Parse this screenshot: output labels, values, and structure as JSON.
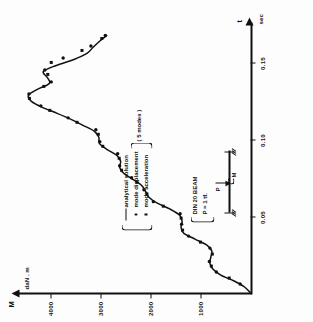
{
  "figure": {
    "orientation": "rotated-90-ccw",
    "axes": {
      "x": {
        "name": "t",
        "unit": "sec",
        "ticks": [
          "0.05",
          "0.10",
          "0.15"
        ],
        "tick_values": [
          0.05,
          0.1,
          0.15
        ],
        "range": [
          0.0,
          0.175
        ]
      },
      "y": {
        "name": "M",
        "unit": "daN . m",
        "ticks": [
          "1000",
          "2000",
          "3000",
          "4000"
        ],
        "tick_values": [
          1000,
          2000,
          3000,
          4000
        ],
        "range": [
          0,
          4600
        ]
      }
    },
    "legend": {
      "items": [
        {
          "mark": "line",
          "label": "analytical solution"
        },
        {
          "mark": "dot",
          "label": "mode displacement"
        },
        {
          "mark": "square",
          "label": "mode acceleration"
        }
      ],
      "group_note": "( 5 modes )"
    },
    "annotation": {
      "brace_lines": [
        "DIN 20 BEAM",
        "P = 1 tf."
      ],
      "sketch": {
        "load_label": "P",
        "moment_label": "M"
      }
    }
  },
  "chart_data": {
    "type": "line",
    "title": "",
    "xlabel": "t  sec",
    "ylabel": "M  daN . m",
    "xlim": [
      0.0,
      0.175
    ],
    "ylim": [
      0,
      4600
    ],
    "grid": false,
    "legend_position": "inside-center",
    "series": [
      {
        "name": "analytical solution",
        "style": "line",
        "x": [
          0.0,
          0.004,
          0.008,
          0.012,
          0.016,
          0.02,
          0.024,
          0.028,
          0.032,
          0.036,
          0.04,
          0.044,
          0.048,
          0.052,
          0.056,
          0.06,
          0.064,
          0.068,
          0.072,
          0.076,
          0.08,
          0.084,
          0.088,
          0.092,
          0.096,
          0.1,
          0.104,
          0.108,
          0.112,
          0.116,
          0.12,
          0.124,
          0.128,
          0.132,
          0.136,
          0.14,
          0.144,
          0.148,
          0.152,
          0.156,
          0.16,
          0.164,
          0.168,
          0.172
        ],
        "y": [
          0,
          120,
          330,
          600,
          760,
          820,
          800,
          780,
          880,
          1120,
          1350,
          1400,
          1380,
          1430,
          1620,
          1880,
          2050,
          2120,
          2200,
          2380,
          2560,
          2640,
          2620,
          2700,
          2900,
          3050,
          3060,
          3150,
          3380,
          3620,
          3900,
          4200,
          4420,
          4480,
          4300,
          4060,
          4100,
          4180,
          3920,
          3560,
          3300,
          3180,
          3050,
          2900
        ]
      },
      {
        "name": "mode displacement",
        "style": "dot",
        "x": [
          0.006,
          0.014,
          0.021,
          0.03,
          0.038,
          0.046,
          0.053,
          0.061,
          0.069,
          0.077,
          0.085,
          0.093,
          0.101,
          0.109,
          0.117,
          0.125,
          0.133,
          0.141,
          0.149,
          0.157,
          0.165,
          0.172
        ],
        "y": [
          210,
          690,
          830,
          820,
          1250,
          1390,
          1420,
          1960,
          2150,
          2400,
          2640,
          2680,
          3040,
          3120,
          3680,
          4230,
          4470,
          4020,
          4150,
          3780,
          3220,
          2930
        ]
      },
      {
        "name": "mode acceleration",
        "style": "square",
        "x": [
          0.01,
          0.018,
          0.026,
          0.034,
          0.042,
          0.05,
          0.058,
          0.066,
          0.074,
          0.082,
          0.09,
          0.098,
          0.106,
          0.114,
          0.122,
          0.13,
          0.138,
          0.146,
          0.154,
          0.162,
          0.17
        ],
        "y": [
          430,
          790,
          770,
          1010,
          1370,
          1400,
          1760,
          2090,
          2290,
          2600,
          2650,
          2980,
          3070,
          3500,
          4050,
          4460,
          4170,
          4090,
          4020,
          3400,
          3000
        ]
      }
    ]
  }
}
